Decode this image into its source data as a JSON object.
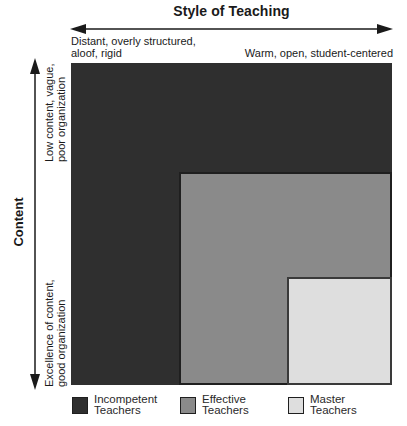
{
  "diagram": {
    "x_axis": {
      "title": "Style of Teaching",
      "left_label_line1": "Distant, overly structured,",
      "left_label_line2": "aloof, rigid",
      "right_label": "Warm, open, student-centered",
      "arrow": "bidirectional-horizontal"
    },
    "y_axis": {
      "title": "Content",
      "top_label_line1": "Low content, vague,",
      "top_label_line2": "poor organization",
      "bottom_label_line1": "Excellence of content,",
      "bottom_label_line2": "good organization",
      "arrow": "bidirectional-vertical"
    },
    "regions": [
      {
        "name": "Incompetent Teachers",
        "color": "#2f2f2f"
      },
      {
        "name": "Effective Teachers",
        "color": "#8a8a8a"
      },
      {
        "name": "Master Teachers",
        "color": "#dedede"
      }
    ],
    "legend": [
      {
        "line1": "Incompetent",
        "line2": "Teachers",
        "color": "#2f2f2f"
      },
      {
        "line1": "Effective",
        "line2": "Teachers",
        "color": "#8a8a8a"
      },
      {
        "line1": "Master",
        "line2": "Teachers",
        "color": "#dedede"
      }
    ]
  }
}
